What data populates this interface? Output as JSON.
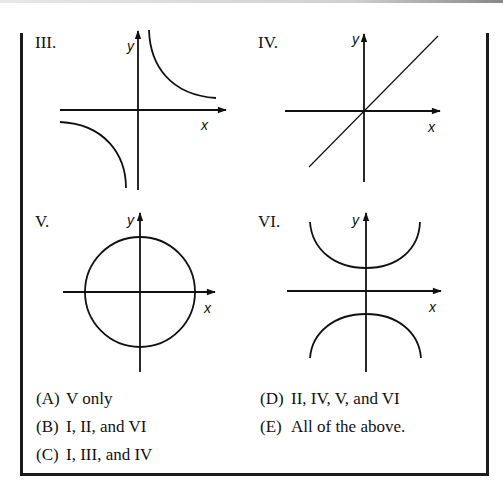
{
  "panels": [
    {
      "id": "III",
      "label": "III.",
      "graph": "hyperbola xy=k (quadrants I and III)",
      "x_label": "x",
      "y_label": "y"
    },
    {
      "id": "IV",
      "label": "IV.",
      "graph": "line y=x through origin",
      "x_label": "x",
      "y_label": "y"
    },
    {
      "id": "V",
      "label": "V.",
      "graph": "circle centered at origin",
      "x_label": "x",
      "y_label": "y"
    },
    {
      "id": "VI",
      "label": "VI.",
      "graph": "hyperbola y^2 - x^2 = k (opening up/down)",
      "x_label": "x",
      "y_label": "y"
    }
  ],
  "choices": [
    {
      "letter": "(A)",
      "text": "V only"
    },
    {
      "letter": "(B)",
      "text": "I, II, and VI"
    },
    {
      "letter": "(C)",
      "text": "I, III, and IV"
    },
    {
      "letter": "(D)",
      "text": "II, IV, V, and VI"
    },
    {
      "letter": "(E)",
      "text": "All of the above."
    }
  ],
  "colors": {
    "ink": "#111111",
    "background": "#ffffff"
  }
}
